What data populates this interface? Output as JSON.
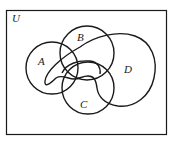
{
  "diagram": {
    "type": "venn",
    "universe_label": "U",
    "sets": [
      {
        "id": "A",
        "label": "A"
      },
      {
        "id": "B",
        "label": "B"
      },
      {
        "id": "C",
        "label": "C"
      },
      {
        "id": "D",
        "label": "D"
      }
    ],
    "colors": {
      "stroke": "#1a1a1a",
      "background": "#ffffff"
    }
  }
}
